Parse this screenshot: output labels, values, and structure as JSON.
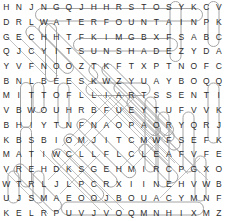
{
  "puzzle": {
    "type": "word-search",
    "columns": 18,
    "rows": 15,
    "ink_color": "#9a9a9a",
    "letter_color": "#2b2b2b",
    "background_color": "#ffffff",
    "grid": [
      [
        "H",
        "N",
        "J",
        "N",
        "G",
        "Q",
        "J",
        "H",
        "H",
        "R",
        "S",
        "T",
        "O",
        "S",
        "Y",
        "K",
        "C",
        "V"
      ],
      [
        "D",
        "R",
        "L",
        "W",
        "A",
        "T",
        "E",
        "R",
        "F",
        "O",
        "U",
        "N",
        "T",
        "A",
        "I",
        "N",
        "P",
        "K"
      ],
      [
        "G",
        "E",
        "C",
        "H",
        "H",
        "T",
        "F",
        "K",
        "I",
        "M",
        "G",
        "B",
        "X",
        "F",
        "S",
        "A",
        "B",
        "C"
      ],
      [
        "Q",
        "J",
        "C",
        "Y",
        "I",
        "T",
        "S",
        "U",
        "N",
        "S",
        "H",
        "A",
        "D",
        "E",
        "Z",
        "Y",
        "D",
        "A"
      ],
      [
        "Y",
        "V",
        "F",
        "N",
        "O",
        "O",
        "Z",
        "T",
        "K",
        "F",
        "T",
        "X",
        "P",
        "T",
        "N",
        "O",
        "F",
        "C"
      ],
      [
        "B",
        "N",
        "L",
        "B",
        "E",
        "E",
        "S",
        "K",
        "W",
        "Z",
        "Y",
        "U",
        "A",
        "Y",
        "B",
        "O",
        "Q",
        "Q"
      ],
      [
        "M",
        "I",
        "T",
        "T",
        "O",
        "F",
        "L",
        "L",
        "I",
        "A",
        "R",
        "T",
        "S",
        "S",
        "E",
        "N",
        "T",
        "I"
      ],
      [
        "V",
        "B",
        "W",
        "O",
        "U",
        "H",
        "R",
        "B",
        "F",
        "U",
        "E",
        "Y",
        "T",
        "U",
        "F",
        "V",
        "V",
        "K"
      ],
      [
        "B",
        "H",
        "I",
        "Y",
        "T",
        "N",
        "F",
        "N",
        "A",
        "O",
        "P",
        "A",
        "O",
        "R",
        "Y",
        "Q",
        "R",
        "J"
      ],
      [
        "K",
        "B",
        "S",
        "B",
        "I",
        "O",
        "M",
        "J",
        "I",
        "T",
        "C",
        "M",
        "W",
        "F",
        "S",
        "E",
        "F",
        "K"
      ],
      [
        "M",
        "A",
        "T",
        "I",
        "W",
        "C",
        "L",
        "L",
        "F",
        "L",
        "C",
        "L",
        "E",
        "A",
        "F",
        "V",
        "F",
        "E"
      ],
      [
        "V",
        "R",
        "E",
        "H",
        "D",
        "K",
        "S",
        "G",
        "E",
        "H",
        "M",
        "I",
        "R",
        "C",
        "P",
        "G",
        "X",
        "O"
      ],
      [
        "W",
        "T",
        "R",
        "L",
        "J",
        "L",
        "P",
        "C",
        "R",
        "X",
        "I",
        "I",
        "N",
        "E",
        "H",
        "V",
        "W",
        "B"
      ],
      [
        "U",
        "J",
        "S",
        "M",
        "A",
        "E",
        "O",
        "O",
        "J",
        "B",
        "O",
        "U",
        "A",
        "C",
        "Y",
        "M",
        "N",
        "F"
      ],
      [
        "K",
        "E",
        "L",
        "R",
        "P",
        "U",
        "V",
        "J",
        "V",
        "O",
        "Q",
        "M",
        "N",
        "H",
        "I",
        "X",
        "M",
        "Z"
      ],
      [
        "V",
        "F",
        "I",
        "G",
        "R",
        "U",
        "G",
        "F",
        "R",
        "U",
        "K",
        "E",
        "Z",
        "O",
        "C",
        "F",
        "E",
        "P"
      ],
      [
        "Y",
        "P",
        "D",
        "S",
        "Q",
        "P",
        "H",
        "I",
        "T",
        "C",
        "B",
        "J",
        "I",
        "O",
        "O",
        "R",
        "N",
        "L"
      ],
      [
        "S",
        "O",
        "E",
        "L",
        "F",
        "T",
        "X",
        "N",
        "F",
        "Y",
        "X",
        "G",
        "M",
        "B",
        "B",
        "X",
        "M",
        "M"
      ],
      [
        "D",
        "O",
        "T",
        "C",
        "J",
        "R",
        "U",
        "B",
        "B",
        "E",
        "R",
        "M",
        "U",
        "L",
        "C",
        "H",
        "E",
        "N"
      ]
    ],
    "found_words": [
      {
        "word": "WATERFOUNTAIN",
        "orientation": "horizontal"
      },
      {
        "word": "SUNSHADE",
        "orientation": "horizontal"
      },
      {
        "word": "TRAILS",
        "orientation": "horizontal-reversed"
      },
      {
        "word": "RUBBERMULCH",
        "orientation": "horizontal"
      },
      {
        "word": "LEAF",
        "orientation": "horizontal"
      },
      {
        "word": "BENCH",
        "orientation": "vertical"
      },
      {
        "word": "SLIDE",
        "orientation": "vertical"
      },
      {
        "word": "SWING",
        "orientation": "diagonal"
      }
    ]
  }
}
